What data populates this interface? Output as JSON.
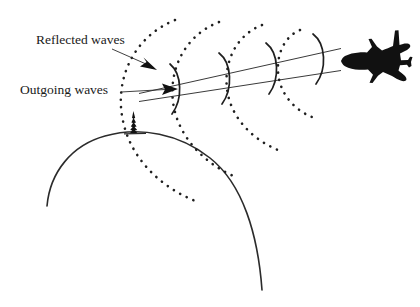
{
  "figure": {
    "background_color": "#ffffff",
    "ink_color": "#1f1f1f",
    "width": 420,
    "height": 307
  },
  "labels": {
    "reflected": {
      "text": "Reflected waves",
      "x": 36,
      "y": 44,
      "font_size": 13.5,
      "pointer_from": [
        136,
        48
      ],
      "pointer_to": [
        155,
        66
      ]
    },
    "outgoing": {
      "text": "Outgoing waves",
      "x": 22,
      "y": 94,
      "font_size": 13.5,
      "pointer_from": [
        122,
        92
      ],
      "pointer_to": [
        172,
        89
      ]
    }
  },
  "elements": {
    "earth": {
      "name": "earth-curve",
      "description": "large arc representing the curved surface of the earth",
      "path": "M 47 206 A 110 110 0 0 1 262 290",
      "stroke_width": 1.6
    },
    "antenna": {
      "name": "radar-antenna",
      "description": "spiky radar tower standing on the horizon",
      "base_x": 133,
      "base_y": 133,
      "height": 22
    },
    "airplane": {
      "name": "airplane-silhouette",
      "description": "black top-view jet airliner silhouette pointing left",
      "center_x": 380,
      "center_y": 56,
      "scale": 1.0,
      "color": "#111111"
    },
    "beam": {
      "name": "radar-beam",
      "description": "two converging straight lines forming the radar beam cone",
      "line_upper": [
        [
          140,
          93
        ],
        [
          340,
          49
        ]
      ],
      "line_lower": [
        [
          140,
          101
        ],
        [
          340,
          71
        ]
      ]
    }
  },
  "wavefronts": {
    "outgoing": {
      "style": "solid",
      "count": 4,
      "description": "solid arcs travelling outward from antenna toward aircraft",
      "arcs": [
        {
          "cx": 178,
          "cy": 89,
          "rx": 13,
          "ry": 26,
          "rotation": -13
        },
        {
          "cx": 228,
          "cy": 78,
          "rx": 14,
          "ry": 28,
          "rotation": -13
        },
        {
          "cx": 274,
          "cy": 68,
          "rx": 14,
          "ry": 27,
          "rotation": -13
        },
        {
          "cx": 320,
          "cy": 58,
          "rx": 14,
          "ry": 26,
          "rotation": -13
        }
      ]
    },
    "reflected": {
      "style": "dotted",
      "count": 4,
      "description": "dotted arcs spreading back from the aircraft toward the radar",
      "arcs": [
        {
          "cx": 318,
          "cy": 60,
          "rx": 36,
          "ry": 40,
          "rotation": -13
        },
        {
          "cx": 318,
          "cy": 60,
          "rx": 74,
          "ry": 76,
          "rotation": -13
        },
        {
          "cx": 318,
          "cy": 60,
          "rx": 112,
          "ry": 112,
          "rotation": -13
        },
        {
          "cx": 318,
          "cy": 60,
          "rx": 152,
          "ry": 150,
          "rotation": -13
        }
      ]
    }
  },
  "arrowheads": {
    "reflected_pointer": {
      "x": 156,
      "y": 67,
      "angle": 36,
      "size": 9
    },
    "outgoing_pointer": {
      "x": 175,
      "y": 89,
      "angle": -8,
      "size": 9
    }
  }
}
